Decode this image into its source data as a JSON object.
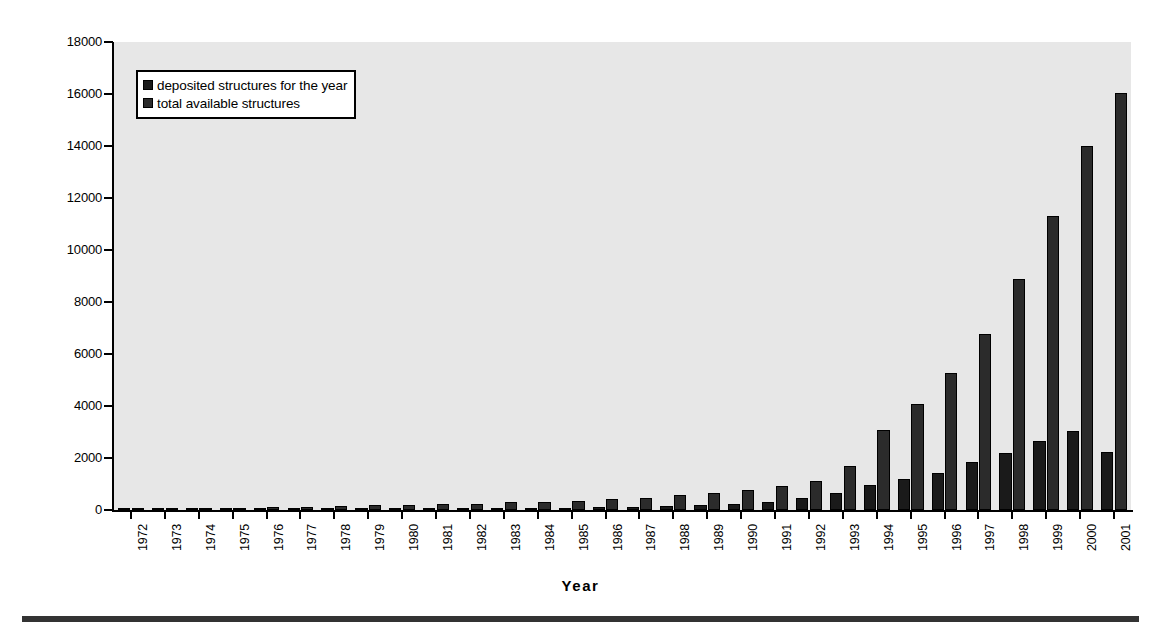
{
  "chart_data": {
    "type": "bar",
    "title": "",
    "xlabel": "Year",
    "ylabel": "",
    "ylim": [
      0,
      18000
    ],
    "ytick_step": 2000,
    "yticks": [
      0,
      2000,
      4000,
      6000,
      8000,
      10000,
      12000,
      14000,
      16000,
      18000
    ],
    "grid": false,
    "legend_position": "upper-left-inside",
    "categories": [
      "1972",
      "1973",
      "1974",
      "1975",
      "1976",
      "1977",
      "1978",
      "1979",
      "1980",
      "1981",
      "1982",
      "1983",
      "1984",
      "1985",
      "1986",
      "1987",
      "1988",
      "1989",
      "1990",
      "1991",
      "1992",
      "1993",
      "1994",
      "1995",
      "1996",
      "1997",
      "1998",
      "1999",
      "2000",
      "2001"
    ],
    "series": [
      {
        "name": "deposited structures for the year",
        "color": "#1a1a1a",
        "values": [
          10,
          8,
          12,
          15,
          22,
          25,
          30,
          35,
          40,
          45,
          50,
          60,
          70,
          80,
          110,
          130,
          170,
          210,
          240,
          320,
          450,
          650,
          980,
          1180,
          1410,
          1840,
          2180,
          2660,
          3030,
          2250
        ]
      },
      {
        "name": "total available structures",
        "color": "#2b2b2b",
        "values": [
          12,
          20,
          32,
          47,
          112,
          125,
          140,
          175,
          200,
          225,
          250,
          290,
          320,
          360,
          430,
          480,
          560,
          660,
          780,
          940,
          1100,
          1690,
          3090,
          4070,
          5280,
          6780,
          8900,
          11300,
          14000,
          16050
        ]
      }
    ]
  },
  "legend": {
    "items": [
      {
        "label": "deposited structures for the year",
        "color": "#1a1a1a"
      },
      {
        "label": "total available structures",
        "color": "#2b2b2b"
      }
    ]
  },
  "axis": {
    "x_title": "Year"
  }
}
